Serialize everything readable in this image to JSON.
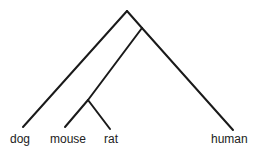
{
  "diagram": {
    "type": "phylogenetic-tree",
    "leaves": [
      {
        "id": "dog",
        "label": "dog"
      },
      {
        "id": "mouse",
        "label": "mouse"
      },
      {
        "id": "rat",
        "label": "rat"
      },
      {
        "id": "human",
        "label": "human"
      }
    ],
    "topology": "(dog,((mouse,rat),human))",
    "colors": {
      "line": "#1a1a1a",
      "text": "#222222",
      "background": "#ffffff"
    }
  }
}
